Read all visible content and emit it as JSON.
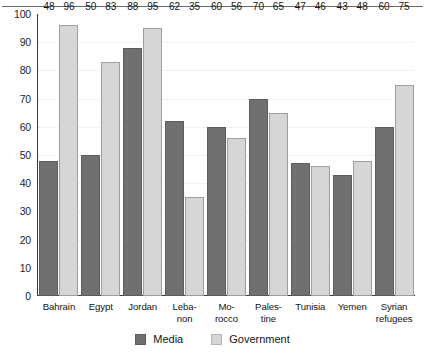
{
  "chart_data": {
    "type": "bar",
    "title": "",
    "subtitle": "",
    "xlabel": "",
    "ylabel": "",
    "ylim": [
      0,
      100
    ],
    "y_ticks": [
      0,
      10,
      20,
      30,
      40,
      50,
      60,
      70,
      80,
      90,
      100
    ],
    "grid": true,
    "legend_position": "bottom-center",
    "categories": [
      "Bahrain",
      "Egypt",
      "Jordan",
      "Leba-non",
      "Mo-rocco",
      "Pales-tine",
      "Tunisia",
      "Yemen",
      "Syrian refugees"
    ],
    "category_lines": [
      [
        "Bahrain"
      ],
      [
        "Egypt"
      ],
      [
        "Jordan"
      ],
      [
        "Leba-",
        "non"
      ],
      [
        "Mo-",
        "rocco"
      ],
      [
        "Pales-",
        "tine"
      ],
      [
        "Tunisia"
      ],
      [
        "Yemen"
      ],
      [
        "Syrian",
        "refugees"
      ]
    ],
    "series": [
      {
        "name": "Media",
        "color": "#707070",
        "values": [
          48,
          50,
          88,
          62,
          60,
          70,
          47,
          43,
          60
        ]
      },
      {
        "name": "Government",
        "color": "#d6d6d6",
        "values": [
          96,
          83,
          95,
          35,
          56,
          65,
          46,
          48,
          75
        ]
      }
    ]
  },
  "legend": {
    "items": [
      {
        "label": "Media",
        "swatch": "media"
      },
      {
        "label": "Government",
        "swatch": "government"
      }
    ]
  }
}
